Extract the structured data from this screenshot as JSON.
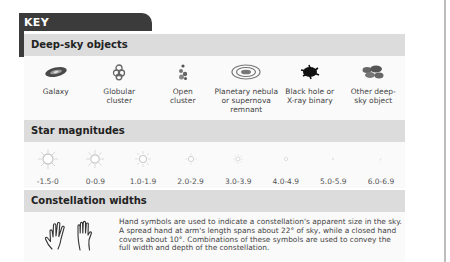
{
  "key": {
    "title": "KEY"
  },
  "deep_sky": {
    "title": "Deep-sky objects",
    "items": [
      {
        "icon": "galaxy-icon",
        "label": "Galaxy"
      },
      {
        "icon": "globular-cluster-icon",
        "label": "Globular cluster"
      },
      {
        "icon": "open-cluster-icon",
        "label": "Open cluster"
      },
      {
        "icon": "planetary-nebula-icon",
        "label": "Planetary nebula or supernova remnant"
      },
      {
        "icon": "black-hole-icon",
        "label": "Black hole or X-ray binary"
      },
      {
        "icon": "other-deep-sky-icon",
        "label": "Other deep-sky object"
      }
    ]
  },
  "magnitudes": {
    "title": "Star magnitudes",
    "items": [
      {
        "label": "-1.5-0",
        "size": 10
      },
      {
        "label": "0-0.9",
        "size": 8.5
      },
      {
        "label": "1.0-1.9",
        "size": 7
      },
      {
        "label": "2.0-2.9",
        "size": 5.5
      },
      {
        "label": "3.0-3.9",
        "size": 4.5
      },
      {
        "label": "4.0-4.9",
        "size": 3.5
      },
      {
        "label": "5.0-5.9",
        "size": 2.5
      },
      {
        "label": "6.0-6.9",
        "size": 2
      }
    ]
  },
  "constellation": {
    "title": "Constellation widths",
    "icons": [
      "spread-hand-icon",
      "closed-hand-icon"
    ],
    "text": "Hand symbols are used to indicate a constellation's apparent size in the sky. A spread hand at arm's length spans about 22° of sky, while a closed hand covers about 10°. Combinations of these symbols are used to convey the full width and depth of the constellation."
  },
  "colors": {
    "tab": "#3b3b3b",
    "header_bg": "#dcdcdc",
    "rule": "#bdbdbd"
  }
}
